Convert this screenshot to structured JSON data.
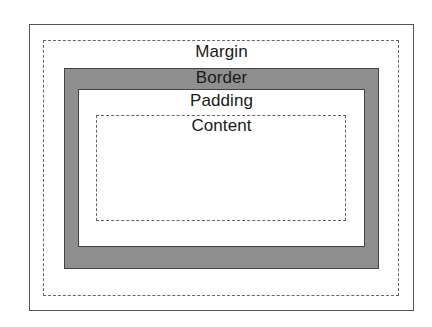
{
  "diagram": {
    "layers": [
      {
        "name": "margin",
        "label": "Margin",
        "style": "dashed"
      },
      {
        "name": "border",
        "label": "Border",
        "style": "filled-gray"
      },
      {
        "name": "padding",
        "label": "Padding",
        "style": "solid"
      },
      {
        "name": "content",
        "label": "Content",
        "style": "dashed"
      }
    ],
    "colors": {
      "border_fill": "#9c9c9c",
      "line": "#444444",
      "background": "#ffffff"
    }
  }
}
